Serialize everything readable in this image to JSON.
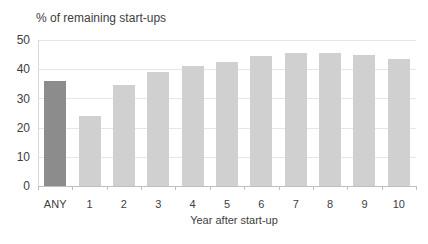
{
  "chart_data": {
    "type": "bar",
    "title": "% of remaining start-ups",
    "xlabel": "Year after start-up",
    "ylabel": "",
    "categories": [
      "ANY",
      "1",
      "2",
      "3",
      "4",
      "5",
      "6",
      "7",
      "8",
      "9",
      "10"
    ],
    "values": [
      36,
      24,
      34.5,
      39,
      41,
      42.5,
      44.5,
      45.5,
      45.5,
      45,
      43.5
    ],
    "ylim": [
      0,
      50
    ],
    "yticks": [
      "0",
      "10",
      "20",
      "30",
      "40",
      "50"
    ],
    "grid": true,
    "legend": null,
    "colors": {
      "highlight": "#8c8c8c",
      "default": "#d0d0d0"
    }
  }
}
